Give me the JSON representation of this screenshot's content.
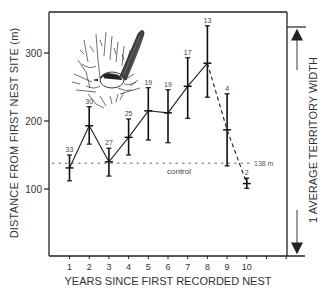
{
  "chart_data": {
    "type": "line",
    "title": "",
    "xlabel": "YEARS SINCE FIRST RECORDED NEST",
    "ylabel": "DISTANCE FROM FIRST NEST SITE (m)",
    "right_annotation": "1 AVERAGE TERRITORY WIDTH",
    "x": [
      1,
      2,
      3,
      4,
      5,
      6,
      7,
      8,
      9,
      10
    ],
    "x_tick_labels": [
      "1",
      "2",
      "3",
      "4",
      "5",
      "6",
      "7",
      "8",
      "9",
      "10"
    ],
    "y_ticks": [
      100,
      200,
      300
    ],
    "y_tick_labels": [
      "100",
      "200",
      "300"
    ],
    "ylim": [
      20,
      360
    ],
    "xlim": [
      0,
      12
    ],
    "grid": false,
    "series": [
      {
        "name": "mean distance",
        "values": [
          131,
          193,
          140,
          176,
          215,
          212,
          251,
          285,
          187,
          108
        ],
        "error_low": [
          112,
          166,
          119,
          150,
          172,
          168,
          204,
          235,
          134,
          101
        ],
        "error_high": [
          150,
          221,
          160,
          203,
          249,
          246,
          293,
          340,
          240,
          116
        ],
        "sample_sizes": [
          "33",
          "30",
          "27",
          "25",
          "19",
          "19",
          "17",
          "13",
          "4",
          "2"
        ],
        "line_style_note": "solid for years 1-8, dashed for years 8-10"
      }
    ],
    "reference_lines": [
      {
        "label": "control",
        "value": 138,
        "value_label": "138 m",
        "style": "dotted"
      }
    ],
    "annotations": [
      {
        "text": "control"
      },
      {
        "text": "138 m"
      },
      {
        "text": "1 AVERAGE TERRITORY WIDTH",
        "type": "bracket-arrow",
        "from": 327,
        "to": 20
      }
    ],
    "illustration": "fairy-wren perched in shrub"
  },
  "labels": {
    "top_text": "· · · · · · · ·"
  }
}
